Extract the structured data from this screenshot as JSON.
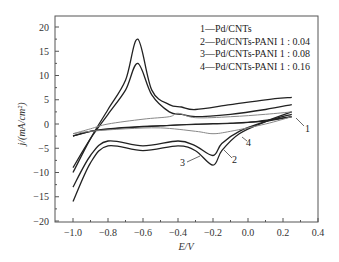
{
  "chart_data": {
    "type": "line",
    "title": "",
    "xlabel": "E/V",
    "ylabel": "j/(mA/cm²)",
    "xlim": [
      -1.1,
      0.4
    ],
    "ylim": [
      -20,
      22
    ],
    "x_ticks": [
      "-1.0",
      "-0.8",
      "-0.6",
      "-0.4",
      "-0.2",
      "0.0",
      "0.2",
      "0.4"
    ],
    "y_ticks": [
      "20",
      "15",
      "10",
      "5",
      "0",
      "-5",
      "-10",
      "-15",
      "-20"
    ],
    "grid": false,
    "legend_position": "upper right",
    "legend": [
      "1—Pd/CNTs",
      "2—Pd/CNTs-PANI 1 : 0.04",
      "3—Pd/CNTs-PANI 1 : 0.08",
      "4—Pd/CNTs-PANI 1 : 0.16"
    ],
    "annotations": [
      "1",
      "2",
      "3",
      "4"
    ],
    "series": [
      {
        "name": "1—Pd/CNTs",
        "forward": {
          "x": [
            -1.0,
            -0.9,
            -0.8,
            -0.6,
            -0.4,
            -0.2,
            0.0,
            0.25
          ],
          "y": [
            -2.5,
            -1.5,
            -1.0,
            -0.5,
            -0.2,
            0.0,
            0.3,
            1.5
          ]
        },
        "reverse": {
          "x": [
            0.25,
            0.1,
            -0.1,
            -0.3,
            -0.5,
            -0.7,
            -0.9,
            -1.0
          ],
          "y": [
            1.5,
            0.6,
            0.2,
            0.0,
            -0.4,
            -0.8,
            -1.5,
            -2.5
          ]
        }
      },
      {
        "name": "2—Pd/CNTs-PANI 1 : 0.04",
        "forward": {
          "x": [
            -1.0,
            -0.9,
            -0.8,
            -0.7,
            -0.63,
            -0.55,
            -0.45,
            -0.38,
            -0.3,
            -0.1,
            0.1,
            0.25
          ],
          "y": [
            -9.0,
            -3.0,
            2.0,
            7.0,
            12.5,
            6.0,
            2.5,
            2.0,
            1.5,
            2.0,
            3.0,
            4.0
          ]
        },
        "reverse": {
          "x": [
            0.25,
            0.1,
            -0.05,
            -0.15,
            -0.2,
            -0.3,
            -0.4,
            -0.6,
            -0.8,
            -0.9,
            -1.0
          ],
          "y": [
            2.0,
            0.5,
            -1.5,
            -4.0,
            -6.5,
            -4.5,
            -3.5,
            -4.5,
            -3.5,
            -6.5,
            -13.0
          ]
        }
      },
      {
        "name": "3—Pd/CNTs-PANI 1 : 0.08",
        "forward": {
          "x": [
            -1.0,
            -0.9,
            -0.8,
            -0.7,
            -0.63,
            -0.55,
            -0.45,
            -0.38,
            -0.3,
            -0.1,
            0.1,
            0.25
          ],
          "y": [
            -10.0,
            -3.0,
            3.0,
            9.0,
            17.5,
            7.0,
            4.0,
            3.5,
            3.0,
            4.0,
            5.0,
            5.5
          ]
        },
        "reverse": {
          "x": [
            0.25,
            0.1,
            -0.05,
            -0.15,
            -0.2,
            -0.3,
            -0.4,
            -0.6,
            -0.8,
            -0.9,
            -1.0
          ],
          "y": [
            2.5,
            0.5,
            -2.0,
            -5.5,
            -8.5,
            -5.5,
            -4.5,
            -5.5,
            -4.5,
            -8.0,
            -16.0
          ]
        }
      },
      {
        "name": "4—Pd/CNTs-PANI 1 : 0.16",
        "forward": {
          "x": [
            -1.0,
            -0.9,
            -0.8,
            -0.6,
            -0.45,
            -0.4,
            -0.3,
            -0.1,
            0.1,
            0.25
          ],
          "y": [
            -2.0,
            -1.0,
            0.0,
            1.0,
            1.5,
            2.2,
            1.3,
            1.5,
            2.0,
            2.5
          ]
        },
        "reverse": {
          "x": [
            0.25,
            0.1,
            -0.1,
            -0.2,
            -0.3,
            -0.5,
            -0.7,
            -0.9,
            -1.0
          ],
          "y": [
            1.5,
            0.0,
            -1.5,
            -2.0,
            -1.5,
            -0.8,
            -1.0,
            -1.5,
            -2.0
          ]
        }
      }
    ]
  }
}
